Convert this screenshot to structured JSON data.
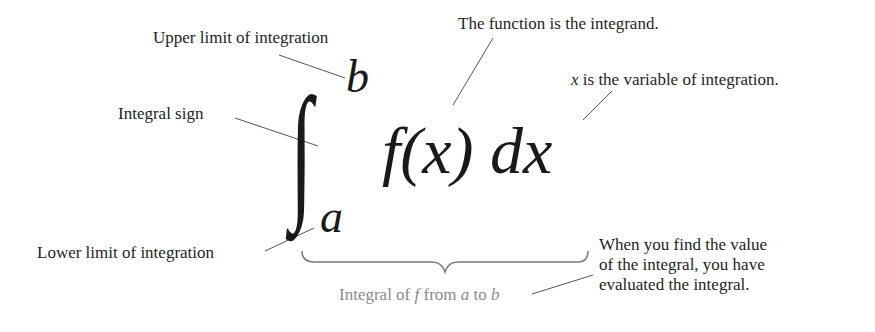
{
  "labels": {
    "upper_limit": "Upper limit of integration",
    "integrand": "The function is the integrand.",
    "variable_prefix": "x",
    "variable_rest": " is the variable of integration.",
    "integral_sign": "Integral sign",
    "lower_limit": "Lower limit of integration",
    "evaluated_line1": "When you find the value",
    "evaluated_line2": "of the integral, you have",
    "evaluated_line3": "evaluated the integral."
  },
  "formula": {
    "integral_symbol": "∫",
    "upper": "b",
    "lower": "a",
    "function": "f(x)",
    "differential": "dx"
  },
  "brace_caption": {
    "part1": "Integral of ",
    "f": "f",
    "part2": " from ",
    "a": "a",
    "part3": " to ",
    "b": "b"
  },
  "colors": {
    "text": "#231f20",
    "caption_gray": "#8a8a8a",
    "leader_line": "#555555"
  }
}
